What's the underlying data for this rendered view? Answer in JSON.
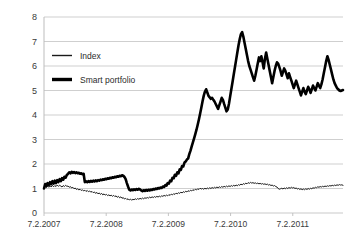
{
  "chart_data": {
    "type": "line",
    "title": "",
    "xlabel": "",
    "ylabel": "",
    "ylim": [
      0,
      8
    ],
    "yticks": [
      0,
      1,
      2,
      3,
      4,
      5,
      6,
      7,
      8
    ],
    "grid": true,
    "legend_position": "upper-left",
    "xtick_labels": [
      "7.2.2007",
      "7.2.2008",
      "7.2.2009",
      "7.2.2010",
      "7.2.2011"
    ],
    "xtick_values": [
      0,
      52,
      104,
      156,
      208
    ],
    "xlim": [
      0,
      250
    ],
    "colors": {
      "index": "#1a1a1a",
      "smart_portfolio": "#000000",
      "gridline": "#c9c9c9",
      "axis": "#bdbdbd",
      "text": "#3a3a3a",
      "background": "#ffffff"
    },
    "series": [
      {
        "name": "Index",
        "line_width": 1,
        "values": [
          1.0,
          1.08,
          1.04,
          1.1,
          1.05,
          1.12,
          1.06,
          1.13,
          1.07,
          1.12,
          1.08,
          1.14,
          1.09,
          1.13,
          1.1,
          1.06,
          1.12,
          1.08,
          1.13,
          1.09,
          1.1,
          1.05,
          1.08,
          1.02,
          1.05,
          0.99,
          1.02,
          0.96,
          0.99,
          0.94,
          0.97,
          0.92,
          0.95,
          0.9,
          0.93,
          0.88,
          0.92,
          0.87,
          0.9,
          0.85,
          0.88,
          0.83,
          0.86,
          0.8,
          0.84,
          0.78,
          0.82,
          0.76,
          0.8,
          0.74,
          0.78,
          0.73,
          0.76,
          0.71,
          0.74,
          0.7,
          0.73,
          0.68,
          0.72,
          0.67,
          0.7,
          0.64,
          0.68,
          0.62,
          0.66,
          0.6,
          0.63,
          0.57,
          0.6,
          0.55,
          0.58,
          0.53,
          0.57,
          0.52,
          0.56,
          0.54,
          0.58,
          0.55,
          0.59,
          0.56,
          0.6,
          0.57,
          0.61,
          0.58,
          0.62,
          0.6,
          0.63,
          0.61,
          0.65,
          0.62,
          0.66,
          0.63,
          0.67,
          0.64,
          0.68,
          0.65,
          0.69,
          0.66,
          0.7,
          0.68,
          0.72,
          0.69,
          0.73,
          0.7,
          0.75,
          0.72,
          0.77,
          0.74,
          0.79,
          0.76,
          0.81,
          0.78,
          0.83,
          0.8,
          0.85,
          0.82,
          0.87,
          0.84,
          0.89,
          0.86,
          0.91,
          0.88,
          0.93,
          0.9,
          0.95,
          0.92,
          0.97,
          0.94,
          0.99,
          0.96,
          1.01,
          0.98,
          1.0,
          0.97,
          1.01,
          0.98,
          1.02,
          0.99,
          1.03,
          1.0,
          1.04,
          1.01,
          1.05,
          1.02,
          1.06,
          1.03,
          1.07,
          1.04,
          1.08,
          1.05,
          1.09,
          1.06,
          1.1,
          1.07,
          1.11,
          1.08,
          1.12,
          1.09,
          1.13,
          1.1,
          1.14,
          1.11,
          1.16,
          1.13,
          1.18,
          1.15,
          1.2,
          1.17,
          1.22,
          1.19,
          1.24,
          1.21,
          1.25,
          1.22,
          1.24,
          1.21,
          1.23,
          1.2,
          1.22,
          1.19,
          1.21,
          1.18,
          1.2,
          1.17,
          1.19,
          1.16,
          1.18,
          1.14,
          1.16,
          1.12,
          1.14,
          1.1,
          1.12,
          1.08,
          1.06,
          1.0,
          0.97,
          0.99,
          1.01,
          0.98,
          1.02,
          0.99,
          1.03,
          1.0,
          1.04,
          1.01,
          1.05,
          1.02,
          1.04,
          1.0,
          1.02,
          0.98,
          1.0,
          0.96,
          0.99,
          0.95,
          0.98,
          0.95,
          0.99,
          0.96,
          1.0,
          0.97,
          1.01,
          0.99,
          1.03,
          1.01,
          1.05,
          1.03,
          1.07,
          1.05,
          1.08,
          1.06,
          1.09,
          1.07,
          1.1,
          1.08,
          1.11,
          1.09,
          1.12,
          1.1,
          1.13,
          1.11,
          1.14,
          1.12,
          1.15,
          1.13,
          1.16,
          1.14,
          1.15,
          1.13
        ]
      },
      {
        "name": "Smart portfolio",
        "line_width": 2.6,
        "values": [
          1.0,
          1.18,
          1.1,
          1.22,
          1.14,
          1.26,
          1.18,
          1.3,
          1.2,
          1.32,
          1.22,
          1.34,
          1.26,
          1.38,
          1.3,
          1.42,
          1.36,
          1.48,
          1.44,
          1.55,
          1.6,
          1.66,
          1.62,
          1.68,
          1.64,
          1.67,
          1.63,
          1.66,
          1.62,
          1.64,
          1.6,
          1.62,
          1.58,
          1.6,
          1.26,
          1.29,
          1.26,
          1.3,
          1.27,
          1.31,
          1.28,
          1.32,
          1.29,
          1.33,
          1.3,
          1.34,
          1.32,
          1.36,
          1.34,
          1.38,
          1.36,
          1.4,
          1.38,
          1.42,
          1.4,
          1.44,
          1.42,
          1.46,
          1.44,
          1.48,
          1.46,
          1.5,
          1.48,
          1.52,
          1.5,
          1.54,
          1.52,
          1.47,
          1.38,
          1.22,
          1.08,
          0.95,
          0.92,
          0.96,
          0.93,
          0.97,
          0.94,
          0.98,
          0.95,
          0.99,
          0.96,
          0.92,
          0.89,
          0.93,
          0.9,
          0.94,
          0.91,
          0.95,
          0.92,
          0.96,
          0.94,
          0.98,
          0.96,
          1.0,
          0.98,
          1.02,
          1.0,
          1.04,
          1.02,
          1.08,
          1.06,
          1.14,
          1.12,
          1.22,
          1.2,
          1.32,
          1.3,
          1.44,
          1.42,
          1.56,
          1.52,
          1.66,
          1.62,
          1.78,
          1.76,
          1.92,
          1.9,
          2.06,
          2.1,
          2.18,
          2.22,
          2.4,
          2.55,
          2.72,
          2.88,
          3.05,
          3.22,
          3.4,
          3.6,
          3.82,
          4.05,
          4.3,
          4.55,
          4.78,
          4.95,
          5.05,
          4.92,
          4.78,
          4.72,
          4.66,
          4.7,
          4.62,
          4.55,
          4.45,
          4.35,
          4.25,
          4.4,
          4.55,
          4.7,
          4.62,
          4.45,
          4.3,
          4.15,
          4.22,
          4.45,
          4.75,
          5.05,
          5.35,
          5.65,
          5.95,
          6.25,
          6.55,
          6.85,
          7.1,
          7.3,
          7.38,
          7.2,
          6.95,
          6.7,
          6.45,
          6.2,
          6.0,
          5.85,
          5.7,
          5.55,
          5.4,
          5.6,
          5.85,
          6.1,
          6.35,
          6.2,
          6.4,
          6.15,
          5.9,
          6.3,
          6.55,
          6.3,
          6.05,
          5.8,
          5.55,
          5.3,
          5.55,
          5.8,
          6.0,
          6.15,
          6.1,
          5.95,
          5.8,
          5.6,
          5.75,
          5.9,
          5.8,
          5.65,
          5.5,
          5.7,
          5.55,
          5.4,
          5.25,
          5.1,
          5.25,
          5.4,
          5.25,
          5.1,
          4.95,
          4.8,
          4.95,
          5.1,
          4.95,
          4.85,
          5.0,
          5.15,
          5.05,
          4.9,
          5.05,
          5.2,
          5.1,
          5.0,
          5.15,
          5.3,
          5.2,
          5.1,
          5.25,
          5.45,
          5.7,
          5.95,
          6.2,
          6.4,
          6.25,
          6.05,
          5.85,
          5.65,
          5.45,
          5.3,
          5.2,
          5.1,
          5.05,
          5.0,
          4.98,
          5.0,
          5.02
        ]
      }
    ]
  },
  "legend": {
    "entries": [
      {
        "label": "Index",
        "swatch": "thin-line-swatch"
      },
      {
        "label": "Smart portfolio",
        "swatch": "thick-line-swatch"
      }
    ]
  }
}
